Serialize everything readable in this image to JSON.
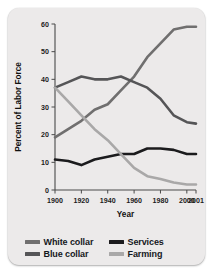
{
  "chart_data": {
    "type": "line",
    "title": "",
    "xlabel": "Year",
    "ylabel": "Percent of Labor Force",
    "x": [
      1900,
      1910,
      1920,
      1930,
      1940,
      1950,
      1960,
      1970,
      1980,
      1990,
      2000,
      2001
    ],
    "xtick_labels": [
      "1900",
      "1920",
      "1940",
      "1960",
      "1980",
      "2000",
      "2001"
    ],
    "xtick_values": [
      1900,
      1920,
      1940,
      1960,
      1980,
      2000,
      2001
    ],
    "ytick_labels": [
      "0",
      "10",
      "20",
      "30",
      "40",
      "50",
      "60"
    ],
    "ytick_values": [
      0,
      10,
      20,
      30,
      40,
      50,
      60
    ],
    "xlim": [
      1900,
      2001
    ],
    "ylim": [
      0,
      60
    ],
    "grid": false,
    "legend_position": "bottom",
    "series": [
      {
        "name": "White collar",
        "color": "#706f6f",
        "values": [
          19,
          22,
          25,
          29,
          31,
          36,
          41,
          48,
          53,
          58,
          59,
          59
        ]
      },
      {
        "name": "Blue collar",
        "color": "#555557",
        "values": [
          37,
          39,
          41,
          40,
          40,
          41,
          39,
          37,
          33,
          27,
          24.5,
          24
        ]
      },
      {
        "name": "Services",
        "color": "#1b1b1d",
        "values": [
          11,
          10.5,
          9,
          11,
          12,
          13,
          13,
          15,
          15,
          14.5,
          13,
          13
        ]
      },
      {
        "name": "Farming",
        "color": "#a9a8a8",
        "values": [
          37,
          32,
          27,
          22,
          18,
          13,
          8,
          5,
          4,
          2.7,
          2,
          2
        ]
      }
    ]
  },
  "legend": {
    "rows": [
      [
        {
          "label": "White collar",
          "color": "#706f6f",
          "icon": "line-swatch-icon"
        },
        {
          "label": "Services",
          "color": "#1b1b1d",
          "icon": "line-swatch-icon"
        }
      ],
      [
        {
          "label": "Blue collar",
          "color": "#555557",
          "icon": "line-swatch-icon"
        },
        {
          "label": "Farming",
          "color": "#a9a8a8",
          "icon": "line-swatch-icon"
        }
      ]
    ]
  }
}
